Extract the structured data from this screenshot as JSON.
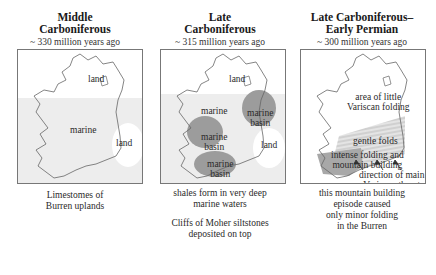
{
  "panels": [
    {
      "title_line1": "Middle",
      "title_line2": "Carboniferous",
      "subtitle": "~ 330 million years ago",
      "labels": {
        "land_north": "land",
        "marine": "marine",
        "land_east": "land"
      },
      "caption": [
        "Limestomes of",
        "Burren uplands"
      ]
    },
    {
      "title_line1": "Late",
      "title_line2": "Carboniferous",
      "subtitle": "~ 315 million years ago",
      "labels": {
        "land_north": "land",
        "marine": "marine",
        "basin_east": [
          "marine",
          "basin"
        ],
        "basin_west": [
          "marine",
          "basin"
        ],
        "basin_south": [
          "marine",
          "basin"
        ],
        "land_east": "land"
      },
      "caption": [
        "shales form in very deep",
        "marine waters"
      ],
      "caption2": [
        "Cliffs of Moher siltstones",
        "deposited on top"
      ]
    },
    {
      "title_line1": "Late Carboniferous–",
      "title_line2": "Early Permian",
      "subtitle": "~ 300 million years ago",
      "labels": {
        "little_folding": [
          "area of little",
          "Variscan folding"
        ],
        "gentle": "gentle folds",
        "intense": [
          "intense folding and",
          "mountain building"
        ],
        "thrust": [
          "direction of main",
          "Variscan thrust"
        ]
      },
      "caption": [
        "this mountain building",
        "episode caused",
        "only minor folding",
        "in the Burren"
      ]
    }
  ],
  "colors": {
    "marine_shade": "#ececec",
    "basin_shade": "#9a9a9a",
    "intense_shade": "#a8a8a8",
    "gentle_shade": "#dcdcdc",
    "coast_line": "#666666"
  }
}
